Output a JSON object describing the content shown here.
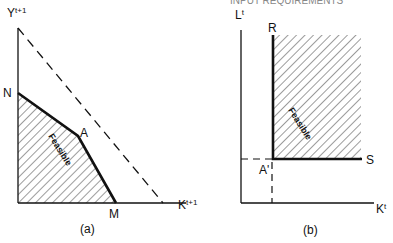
{
  "header": {
    "left_cut_text": "",
    "right_cut_text": "INPUT REQUIREMENTS"
  },
  "panel_a": {
    "caption": "(a)",
    "y_axis_label": "Y",
    "y_axis_sup": "t+1",
    "x_axis_label": "K",
    "x_axis_sup": "t+1",
    "point_n": "N",
    "point_a": "A",
    "point_m": "M",
    "region_label": "Feasible"
  },
  "panel_b": {
    "caption": "(b)",
    "y_axis_label": "L",
    "y_axis_sup": "t",
    "x_axis_label": "K",
    "x_axis_sup": "t",
    "point_r": "R",
    "point_a_prime": "A'",
    "point_s": "S",
    "region_label": "Feasible"
  },
  "colors": {
    "ink": "#111111",
    "background": "#ffffff"
  }
}
